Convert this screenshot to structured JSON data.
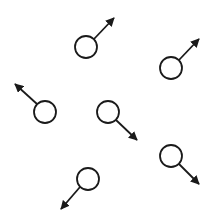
{
  "diagram": {
    "stroke_color": "#1a1a1a",
    "background": "#ffffff",
    "particles": [
      {
        "cx": 86,
        "cy": 47,
        "r": 11,
        "arrow": {
          "x1": 94,
          "y1": 39,
          "x2": 114,
          "y2": 18
        }
      },
      {
        "cx": 171,
        "cy": 68,
        "r": 11,
        "arrow": {
          "x1": 179,
          "y1": 60,
          "x2": 199,
          "y2": 39
        }
      },
      {
        "cx": 45,
        "cy": 112,
        "r": 11,
        "arrow": {
          "x1": 37,
          "y1": 104,
          "x2": 15,
          "y2": 84
        }
      },
      {
        "cx": 108,
        "cy": 112,
        "r": 11,
        "arrow": {
          "x1": 116,
          "y1": 120,
          "x2": 137,
          "y2": 140
        }
      },
      {
        "cx": 171,
        "cy": 156,
        "r": 11,
        "arrow": {
          "x1": 179,
          "y1": 164,
          "x2": 199,
          "y2": 184
        }
      },
      {
        "cx": 88,
        "cy": 179,
        "r": 11,
        "arrow": {
          "x1": 80,
          "y1": 187,
          "x2": 61,
          "y2": 209
        }
      }
    ]
  }
}
